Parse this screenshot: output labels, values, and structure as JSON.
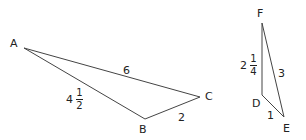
{
  "triangle_abc": {
    "vertices": {
      "A": "A",
      "B": "B",
      "C": "C"
    },
    "sides": {
      "AC": "6",
      "AB": {
        "whole": "4",
        "num": "1",
        "den": "2"
      },
      "BC": "2"
    }
  },
  "triangle_def": {
    "vertices": {
      "D": "D",
      "E": "E",
      "F": "F"
    },
    "sides": {
      "FE": "3",
      "FD": {
        "whole": "2",
        "num": "1",
        "den": "4"
      },
      "DE": "1"
    }
  },
  "colors": {
    "line": "#444444",
    "text": "#222222",
    "background": "#ffffff"
  }
}
